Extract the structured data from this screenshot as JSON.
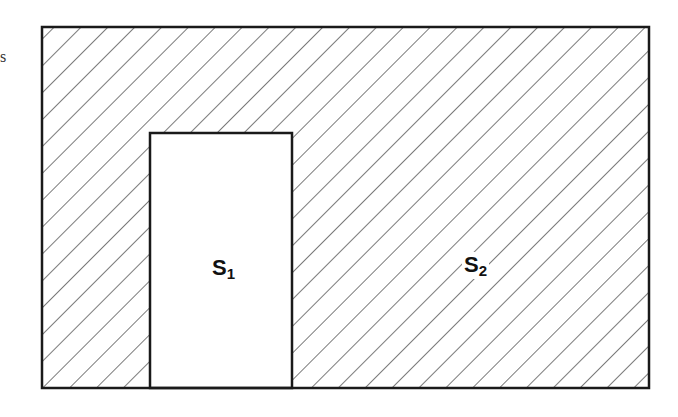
{
  "diagram": {
    "stray_text": "s",
    "outer_region": {
      "label": "S",
      "subscript": "2",
      "fill": "hatched",
      "line_color": "#222222"
    },
    "inner_region": {
      "label": "S",
      "subscript": "1",
      "fill": "#ffffff"
    }
  }
}
